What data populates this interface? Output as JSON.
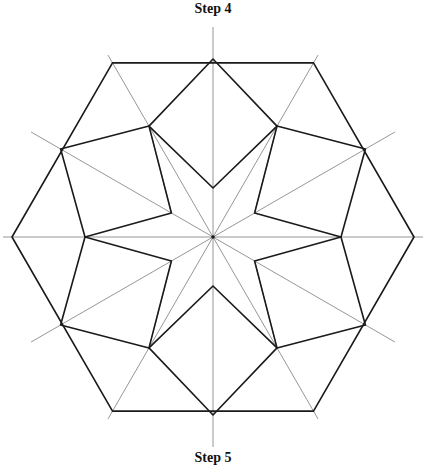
{
  "captions": {
    "top": "Step 4",
    "bottom": "Step 5"
  },
  "figure": {
    "center": [
      213,
      237
    ],
    "hex_radius": 201,
    "guide_ray_count": 12,
    "guide_ray_length": 210,
    "colors": {
      "thick_line": "#1a1a1a",
      "guide_line": "#8a8a8a",
      "background": "#ffffff"
    }
  }
}
